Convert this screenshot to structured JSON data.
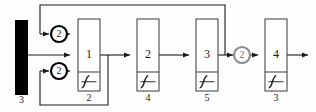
{
  "diagram": {
    "type": "block-diagram",
    "title": "",
    "input": {
      "name": "input-bar",
      "style": "solid-black-bar",
      "label": "3"
    },
    "delays": [
      {
        "name": "delay-top",
        "value": "2",
        "color": "#000000",
        "cx": 59,
        "cy": 34
      },
      {
        "name": "delay-bottom",
        "value": "2",
        "color": "#000000",
        "cx": 59,
        "cy": 71
      },
      {
        "name": "delay-output",
        "value": "2",
        "color": "#8d8d8d",
        "cx": 242,
        "cy": 55
      }
    ],
    "layers": [
      {
        "name": "layer-1",
        "number": "1",
        "count": "2",
        "activation": "sigmoid-ramp",
        "x": 78,
        "y": 19,
        "w": 22,
        "h": 72
      },
      {
        "name": "layer-2",
        "number": "2",
        "count": "4",
        "activation": "sigmoid-ramp",
        "x": 137,
        "y": 19,
        "w": 22,
        "h": 72
      },
      {
        "name": "layer-3",
        "number": "3",
        "count": "5",
        "activation": "sigmoid-ramp",
        "x": 196,
        "y": 19,
        "w": 22,
        "h": 72
      },
      {
        "name": "layer-4",
        "number": "4",
        "count": "3",
        "activation": "sigmoid-ramp",
        "x": 265,
        "y": 19,
        "w": 22,
        "h": 72
      }
    ],
    "feedback": [
      {
        "name": "feedback-top",
        "from": "layer-3-output",
        "to": "delay-top"
      },
      {
        "name": "feedback-bottom",
        "from": "layer-1-output",
        "to": "delay-bottom"
      }
    ],
    "colors": {
      "line": "#1a1a1a",
      "gray_line": "#8d8d8d",
      "block_border": "#4a4a4a",
      "input_fill": "#000000",
      "background": "#fdfdfd"
    }
  }
}
